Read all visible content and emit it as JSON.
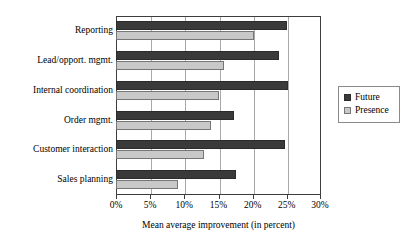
{
  "chart_data": {
    "type": "bar",
    "orientation": "horizontal",
    "title": "",
    "xlabel": "Mean average improvement (in percent)",
    "ylabel": "",
    "xlim": [
      0,
      30
    ],
    "xticks": [
      0,
      5,
      10,
      15,
      20,
      25,
      30
    ],
    "xtick_labels": [
      "0%",
      "5%",
      "10%",
      "15%",
      "20%",
      "25%",
      "30%"
    ],
    "grid": true,
    "legend_position": "right",
    "categories": [
      "Reporting",
      "Lead/opport. mgmt.",
      "Internal coordination",
      "Order mgmt.",
      "Customer interaction",
      "Sales planning"
    ],
    "series": [
      {
        "name": "Future",
        "color": "#3a3a3a",
        "values": [
          25.0,
          23.8,
          25.2,
          17.3,
          24.7,
          17.6
        ]
      },
      {
        "name": "Presence",
        "color": "#c8c8c8",
        "values": [
          20.2,
          15.8,
          15.0,
          13.9,
          12.9,
          9.0
        ]
      }
    ]
  },
  "legend": {
    "items": [
      {
        "label": "Future",
        "swatch": "future"
      },
      {
        "label": "Presence",
        "swatch": "presence"
      }
    ]
  }
}
